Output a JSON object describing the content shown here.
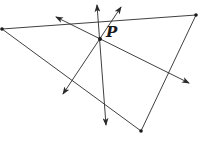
{
  "diagram": {
    "width": 204,
    "height": 147,
    "stroke_color": "#2a2a2a",
    "background": "#ffffff",
    "vertices": [
      {
        "name": "left-vertex",
        "x": 2,
        "y": 29
      },
      {
        "name": "top-right-vertex",
        "x": 196,
        "y": 15
      },
      {
        "name": "bottom-vertex",
        "x": 141,
        "y": 131
      }
    ],
    "point_p": {
      "x": 100,
      "y": 39,
      "label": "P",
      "label_x": 106,
      "label_y": 37
    },
    "lines": [
      {
        "name": "bisector-line-1",
        "x1": 97,
        "y1": 5,
        "x2": 106,
        "y2": 125,
        "arrows": "both"
      },
      {
        "name": "bisector-line-2",
        "x1": 121,
        "y1": 7,
        "x2": 63,
        "y2": 94,
        "arrows": "both"
      },
      {
        "name": "bisector-line-3",
        "x1": 56,
        "y1": 17,
        "x2": 189,
        "y2": 83,
        "arrows": "both"
      }
    ]
  }
}
